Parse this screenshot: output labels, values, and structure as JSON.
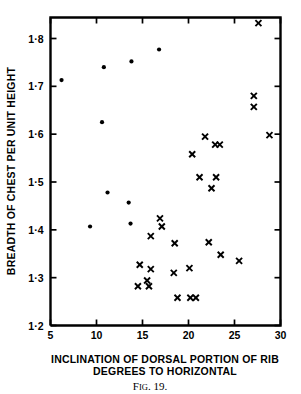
{
  "figure": {
    "caption": "FIG. 19.",
    "caption_main": "F",
    "caption_small": "IG",
    "caption_rest": ". 19."
  },
  "chart_data": {
    "type": "scatter",
    "title": "",
    "xlabel_line1": "INCLINATION OF DORSAL PORTION OF RIB",
    "xlabel_line2": "DEGREES TO HORIZONTAL",
    "ylabel": "BREADTH OF CHEST PER UNIT HEIGHT",
    "xlim": [
      5,
      30
    ],
    "ylim": [
      1.2,
      1.85
    ],
    "xticks": [
      5,
      10,
      15,
      20,
      25,
      30
    ],
    "xticklabels": [
      "5",
      "10",
      "15",
      "20",
      "25",
      "30"
    ],
    "yticks": [
      1.2,
      1.3,
      1.4,
      1.5,
      1.6,
      1.7,
      1.8
    ],
    "yticklabels": [
      "1·2",
      "1·3",
      "1·4",
      "1·5",
      "1·6",
      "1·7",
      "1·8"
    ],
    "grid": false,
    "legend": "none",
    "series": [
      {
        "name": "dot-group",
        "marker": "dot",
        "points": [
          [
            6.2,
            1.713
          ],
          [
            10.8,
            1.74
          ],
          [
            13.8,
            1.752
          ],
          [
            16.8,
            1.777
          ],
          [
            10.6,
            1.625
          ],
          [
            11.2,
            1.478
          ],
          [
            13.5,
            1.457
          ],
          [
            13.7,
            1.413
          ],
          [
            9.3,
            1.407
          ]
        ]
      },
      {
        "name": "cross-group",
        "marker": "cross",
        "points": [
          [
            27.6,
            1.832
          ],
          [
            27.1,
            1.68
          ],
          [
            27.1,
            1.657
          ],
          [
            21.8,
            1.595
          ],
          [
            22.9,
            1.578
          ],
          [
            23.4,
            1.578
          ],
          [
            20.4,
            1.558
          ],
          [
            28.8,
            1.598
          ],
          [
            21.2,
            1.51
          ],
          [
            23.0,
            1.51
          ],
          [
            22.5,
            1.487
          ],
          [
            16.9,
            1.424
          ],
          [
            17.1,
            1.407
          ],
          [
            15.9,
            1.387
          ],
          [
            18.5,
            1.372
          ],
          [
            22.2,
            1.374
          ],
          [
            23.5,
            1.348
          ],
          [
            25.5,
            1.335
          ],
          [
            14.7,
            1.327
          ],
          [
            15.9,
            1.318
          ],
          [
            18.4,
            1.31
          ],
          [
            20.1,
            1.32
          ],
          [
            15.5,
            1.294
          ],
          [
            14.5,
            1.282
          ],
          [
            15.7,
            1.282
          ],
          [
            18.8,
            1.258
          ],
          [
            20.2,
            1.258
          ],
          [
            20.8,
            1.258
          ]
        ]
      }
    ]
  }
}
